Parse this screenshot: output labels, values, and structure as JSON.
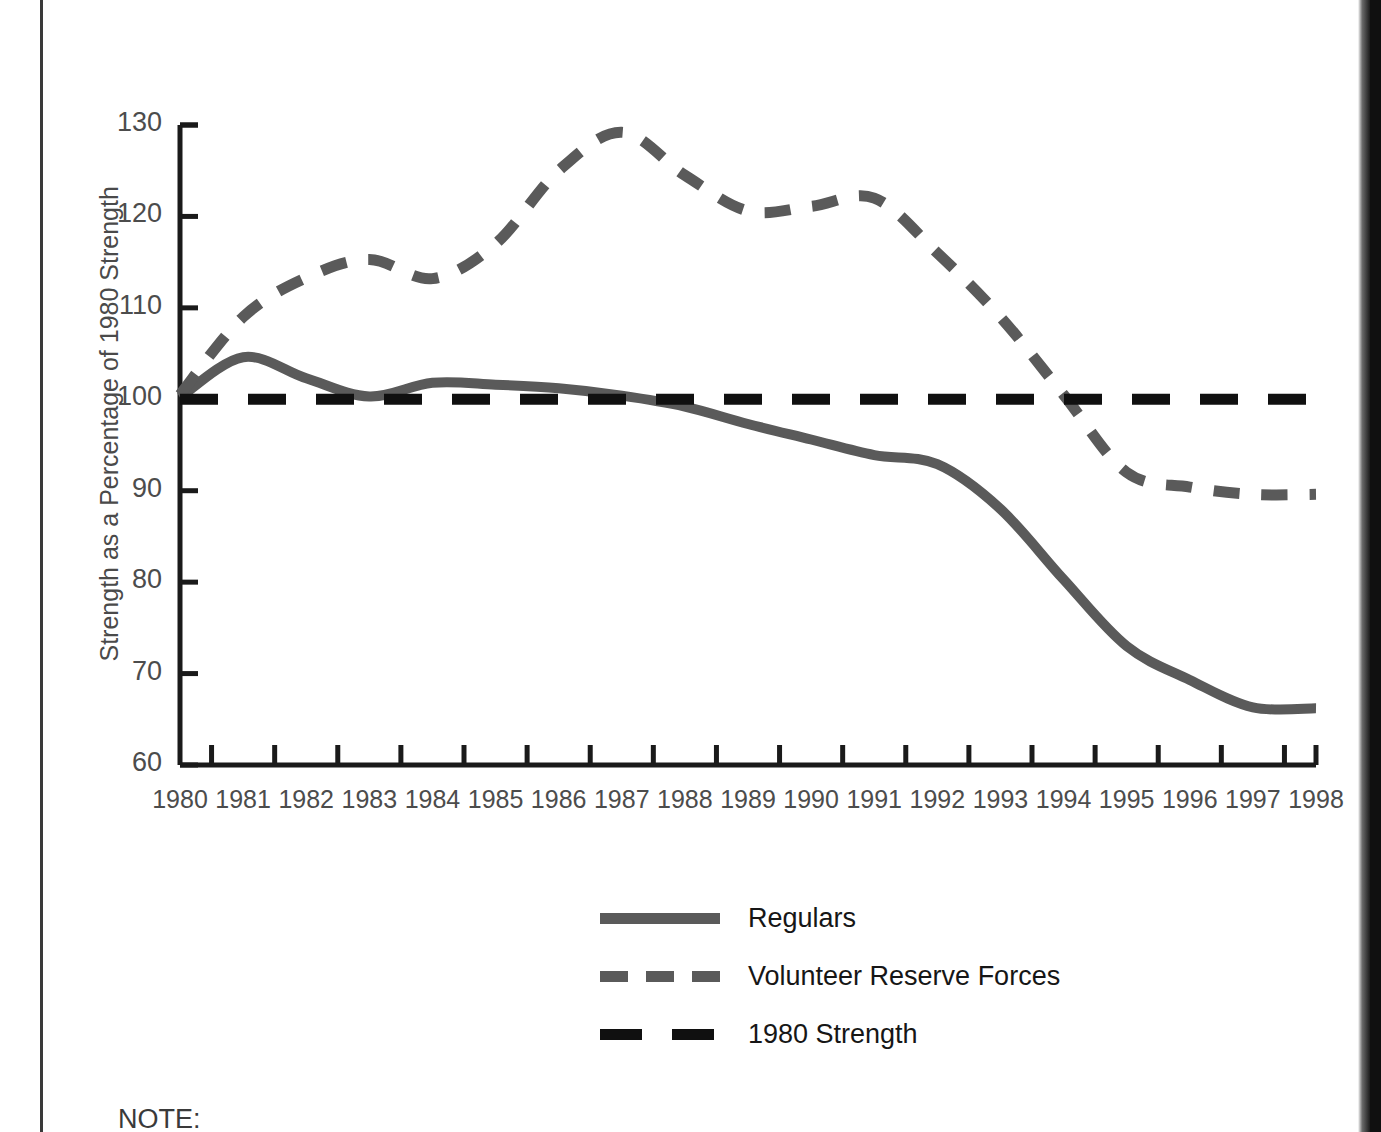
{
  "chart_data": {
    "type": "line",
    "title": "",
    "xlabel": "",
    "ylabel": "Strength as a Percentage of 1980 Strength",
    "xlim": [
      1980,
      1998
    ],
    "ylim": [
      60,
      130
    ],
    "yticks": [
      60,
      70,
      80,
      90,
      100,
      110,
      120,
      130
    ],
    "xticks": [
      1980,
      1981,
      1982,
      1983,
      1984,
      1985,
      1986,
      1987,
      1988,
      1989,
      1990,
      1991,
      1992,
      1993,
      1994,
      1995,
      1996,
      1997,
      1998
    ],
    "grid": false,
    "legend_position": "bottom-center",
    "x": [
      1980,
      1981,
      1982,
      1983,
      1984,
      1985,
      1986,
      1987,
      1988,
      1989,
      1990,
      1991,
      1992,
      1993,
      1994,
      1995,
      1996,
      1997,
      1998
    ],
    "series": [
      {
        "name": "Regulars",
        "style": "solid",
        "color": "#5a5a5a",
        "values": [
          100.2,
          104.6,
          102.3,
          100.3,
          101.8,
          101.6,
          101.2,
          100.4,
          99.2,
          97.3,
          95.6,
          93.9,
          92.9,
          88.0,
          80.3,
          73.0,
          69.3,
          66.3,
          66.2
        ]
      },
      {
        "name": "Volunteer Reserve Forces",
        "style": "dashed",
        "color": "#5a5a5a",
        "values": [
          100.5,
          109.0,
          113.3,
          115.3,
          113.2,
          117.0,
          125.0,
          129.2,
          124.5,
          120.6,
          121.1,
          122.0,
          116.0,
          109.0,
          100.5,
          92.0,
          90.4,
          89.6,
          89.6
        ]
      },
      {
        "name": "1980 Strength",
        "style": "dashed",
        "color": "#101010",
        "values": [
          100,
          100,
          100,
          100,
          100,
          100,
          100,
          100,
          100,
          100,
          100,
          100,
          100,
          100,
          100,
          100,
          100,
          100,
          100
        ]
      }
    ]
  },
  "legend": {
    "items": [
      {
        "label": "Regulars",
        "style": "solid",
        "color": "#5a5a5a"
      },
      {
        "label": "Volunteer Reserve Forces",
        "style": "dashed",
        "color": "#5a5a5a"
      },
      {
        "label": "1980 Strength",
        "style": "dashed-long",
        "color": "#101010"
      }
    ]
  },
  "note": {
    "label": "NOTE:"
  },
  "colors": {
    "gray_series": "#5a5a5a",
    "black_series": "#101010",
    "axis": "#1a1a1a",
    "tick_text": "#4c4c4c",
    "background": "#ffffff"
  }
}
